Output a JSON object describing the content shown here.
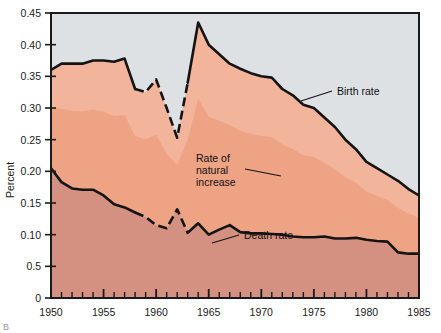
{
  "figure": {
    "corner_label": "B",
    "y_axis_title": "Percent"
  },
  "chart_data": {
    "type": "area",
    "title": "",
    "subtitle": "",
    "xlabel": "",
    "ylabel": "Percent",
    "xlim": [
      1950,
      1985
    ],
    "ylim": [
      0,
      0.45
    ],
    "grid": false,
    "legend_position": "inline-annotations",
    "stacked": true,
    "x_tick_labels": [
      "1950",
      "1955",
      "1960",
      "1965",
      "1970",
      "1975",
      "1980",
      "1985"
    ],
    "x_tick_values": [
      1950,
      1955,
      1960,
      1965,
      1970,
      1975,
      1980,
      1985
    ],
    "x_minor_tick_interval": 1,
    "y_tick_labels": [
      "0",
      "0.5",
      "0.10",
      "0.15",
      "0.20",
      "0.25",
      "0.30",
      "0.35",
      "0.40",
      "0.45"
    ],
    "y_tick_values": [
      0,
      0.05,
      0.1,
      0.15,
      0.2,
      0.25,
      0.3,
      0.35,
      0.4,
      0.45
    ],
    "x": [
      1950,
      1951,
      1952,
      1953,
      1954,
      1955,
      1956,
      1957,
      1958,
      1959,
      1960,
      1961,
      1962,
      1963,
      1964,
      1965,
      1966,
      1967,
      1968,
      1969,
      1970,
      1971,
      1972,
      1973,
      1974,
      1975,
      1976,
      1977,
      1978,
      1979,
      1980,
      1981,
      1982,
      1983,
      1984,
      1985
    ],
    "series": [
      {
        "name": "Birth rate",
        "label": "Birth rate",
        "color": "#f2b49b",
        "dashed_range": [
          1958,
          1963
        ],
        "values": [
          0.36,
          0.37,
          0.37,
          0.37,
          0.375,
          0.375,
          0.373,
          0.378,
          0.33,
          0.325,
          0.345,
          0.3,
          0.253,
          0.34,
          0.435,
          0.4,
          0.385,
          0.37,
          0.362,
          0.355,
          0.35,
          0.348,
          0.33,
          0.32,
          0.305,
          0.3,
          0.285,
          0.27,
          0.25,
          0.235,
          0.215,
          0.205,
          0.195,
          0.185,
          0.172,
          0.162
        ]
      },
      {
        "name": "Death rate",
        "label": "Death rate",
        "color": "#d89180",
        "dashed_range": [
          1958,
          1963
        ],
        "values": [
          0.205,
          0.183,
          0.173,
          0.171,
          0.171,
          0.162,
          0.148,
          0.143,
          0.135,
          0.128,
          0.115,
          0.11,
          0.14,
          0.103,
          0.118,
          0.1,
          0.108,
          0.115,
          0.104,
          0.102,
          0.102,
          0.101,
          0.1,
          0.097,
          0.096,
          0.096,
          0.097,
          0.094,
          0.094,
          0.095,
          0.092,
          0.09,
          0.089,
          0.072,
          0.07,
          0.07
        ]
      },
      {
        "name": "Rate of natural increase",
        "label": "Rate of natural increase",
        "color": "#eda384",
        "description": "area between birth rate and death rate",
        "values": [
          0.155,
          0.187,
          0.197,
          0.199,
          0.204,
          0.213,
          0.225,
          0.235,
          0.195,
          0.197,
          0.23,
          0.19,
          0.113,
          0.237,
          0.317,
          0.3,
          0.277,
          0.255,
          0.258,
          0.253,
          0.248,
          0.247,
          0.23,
          0.223,
          0.209,
          0.204,
          0.188,
          0.176,
          0.156,
          0.14,
          0.123,
          0.115,
          0.106,
          0.113,
          0.102,
          0.092
        ]
      }
    ],
    "annotations": [
      {
        "text": "Birth rate",
        "x": 1975,
        "y": 0.33
      },
      {
        "text": "Rate of natural increase",
        "x": 1966,
        "y": 0.205
      },
      {
        "text": "Death rate",
        "x": 1967,
        "y": 0.12
      }
    ],
    "colors": {
      "background": "#dde1e3",
      "birth_band": "#f2b49b",
      "natural_increase_band": "#eda384",
      "death_band": "#d49080",
      "line": "#141414",
      "axis": "#1a1a1a"
    }
  }
}
